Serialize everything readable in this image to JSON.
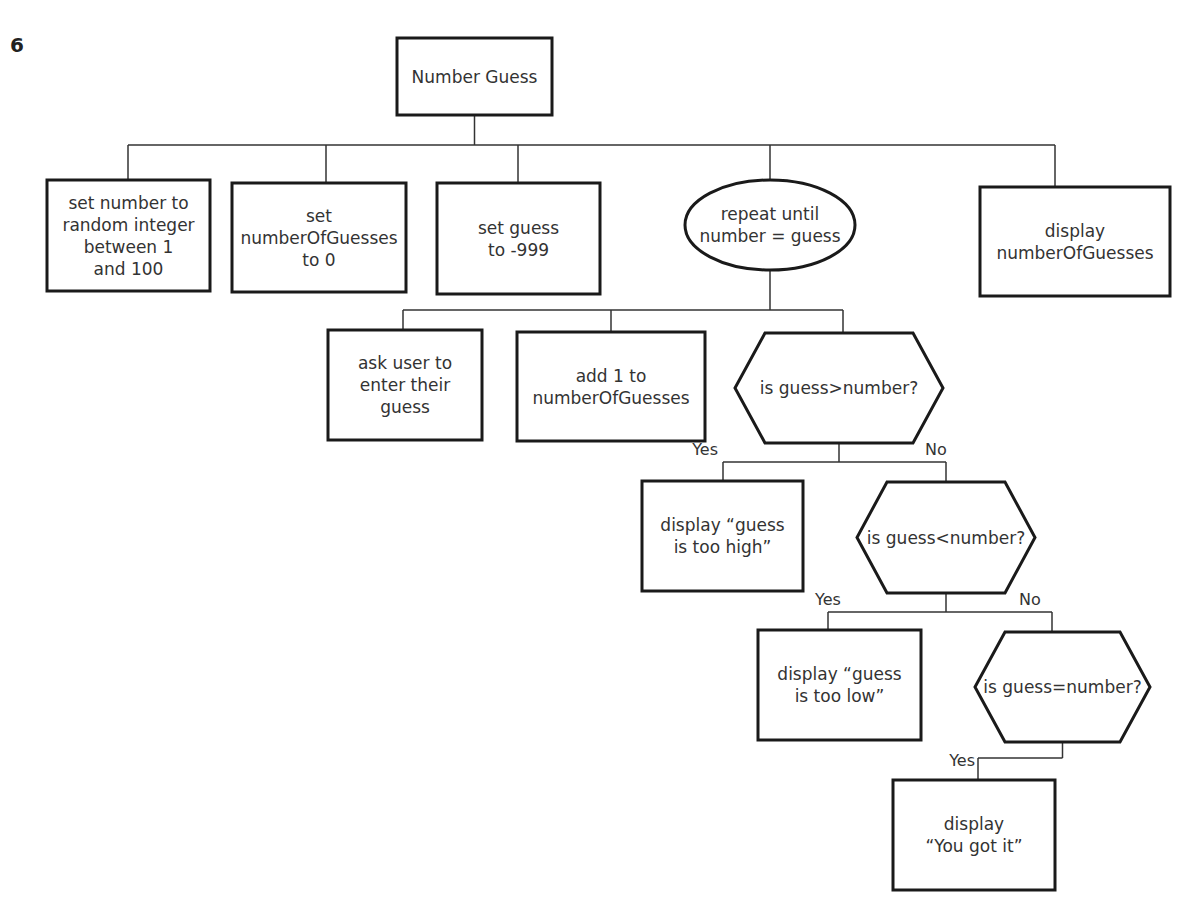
{
  "question_number": "6",
  "diagram": {
    "title": "Number Guess",
    "nodes": {
      "root": {
        "shape": "rectangle",
        "lines": [
          "Number Guess"
        ]
      },
      "set_number": {
        "shape": "rectangle",
        "lines": [
          "set number to",
          "random integer",
          "between 1",
          "and 100"
        ]
      },
      "set_guesses": {
        "shape": "rectangle",
        "lines": [
          "set",
          "numberOfGuesses",
          "to 0"
        ]
      },
      "set_guess": {
        "shape": "rectangle",
        "lines": [
          "set guess",
          "to -999"
        ]
      },
      "repeat": {
        "shape": "ellipse",
        "lines": [
          "repeat until",
          "number = guess"
        ]
      },
      "display_count": {
        "shape": "rectangle",
        "lines": [
          "display",
          "numberOfGuesses"
        ]
      },
      "ask_user": {
        "shape": "rectangle",
        "lines": [
          "ask user to",
          "enter their",
          "guess"
        ]
      },
      "add_one": {
        "shape": "rectangle",
        "lines": [
          "add 1 to",
          "numberOfGuesses"
        ]
      },
      "q_greater": {
        "shape": "hexagon",
        "lines": [
          "is guess>number?"
        ]
      },
      "too_high": {
        "shape": "rectangle",
        "lines": [
          "display “guess",
          "is too high”"
        ]
      },
      "q_less": {
        "shape": "hexagon",
        "lines": [
          "is guess<number?"
        ]
      },
      "too_low": {
        "shape": "rectangle",
        "lines": [
          "display “guess",
          "is too low”"
        ]
      },
      "q_equal": {
        "shape": "hexagon",
        "lines": [
          "is guess=number?"
        ]
      },
      "got_it": {
        "shape": "rectangle",
        "lines": [
          "display",
          "“You got it”"
        ]
      }
    },
    "edges": [
      {
        "from": "root",
        "to": "set_number",
        "label": ""
      },
      {
        "from": "root",
        "to": "set_guesses",
        "label": ""
      },
      {
        "from": "root",
        "to": "set_guess",
        "label": ""
      },
      {
        "from": "root",
        "to": "repeat",
        "label": ""
      },
      {
        "from": "root",
        "to": "display_count",
        "label": ""
      },
      {
        "from": "repeat",
        "to": "ask_user",
        "label": ""
      },
      {
        "from": "repeat",
        "to": "add_one",
        "label": ""
      },
      {
        "from": "repeat",
        "to": "q_greater",
        "label": ""
      },
      {
        "from": "q_greater",
        "to": "too_high",
        "label": "Yes"
      },
      {
        "from": "q_greater",
        "to": "q_less",
        "label": "No"
      },
      {
        "from": "q_less",
        "to": "too_low",
        "label": "Yes"
      },
      {
        "from": "q_less",
        "to": "q_equal",
        "label": "No"
      },
      {
        "from": "q_equal",
        "to": "got_it",
        "label": "Yes"
      }
    ],
    "branch_labels": {
      "yes": "Yes",
      "no": "No"
    }
  }
}
